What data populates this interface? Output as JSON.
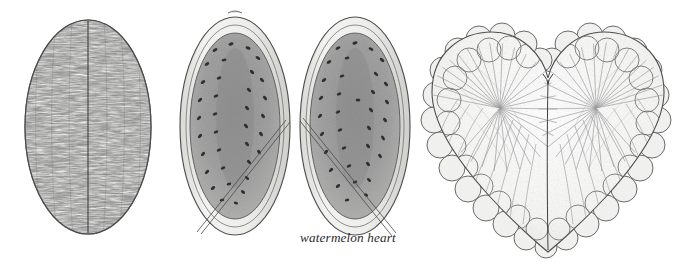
{
  "plate": {
    "title": "watermelon heart",
    "medium": "graphite pencil illustration plate",
    "background_color": "#ffffff",
    "ink_color": "#2b2b2b",
    "flesh_color": "#9a9a9a",
    "rind_color": "#e8e8e6",
    "seed_color": "#3a3a3a",
    "hatch_color": "#8d8d8d"
  },
  "caption": {
    "text": "watermelon heart",
    "style": "italic lowercase serif",
    "color": "#2b2b2b"
  },
  "figures": [
    {
      "id": "whole-melon",
      "name": "whole watermelon, exterior view",
      "shape": "vertical oblong oval",
      "features": [
        "mottled vertical stripes",
        "central seam line",
        "speckled rind texture"
      ]
    },
    {
      "id": "melon-half-left",
      "name": "halved watermelon, cut face left",
      "shape": "vertical oblong oval",
      "features": [
        "pale rind band",
        "gray flesh",
        "scattered dark seeds in rows",
        "diagonal leader line"
      ]
    },
    {
      "id": "melon-half-right",
      "name": "halved watermelon, cut face right",
      "shape": "vertical oblong oval",
      "features": [
        "pale rind band",
        "gray flesh",
        "scattered dark seeds in rows",
        "diagonal leader line"
      ]
    },
    {
      "id": "watermelon-heart",
      "name": "scalloped heart form",
      "shape": "lobed heart",
      "features": [
        "double scalloped border",
        "radiating hatch lines",
        "central vertical seam",
        "cleft at top"
      ]
    }
  ],
  "leader_lines": [
    {
      "from": "melon-half-left",
      "to": "caption"
    },
    {
      "from": "melon-half-right",
      "to": "caption"
    }
  ]
}
